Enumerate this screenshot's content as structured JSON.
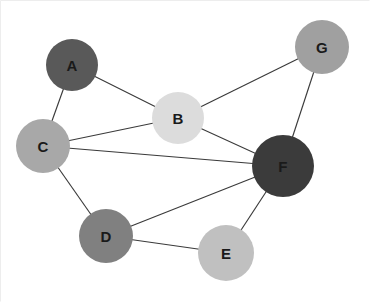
{
  "figure": {
    "background_color": "#ffffff",
    "width": 370,
    "height": 302,
    "frame_color": "#ededed"
  },
  "chart_data": {
    "type": "diagram",
    "subtype": "node-link-graph",
    "title": "",
    "directed": false,
    "edge_color": "#3a3a3a",
    "edge_width": 1.15,
    "node_count": 7,
    "edge_count": 11,
    "nodes": [
      {
        "id": "A",
        "label": "A",
        "x": 72,
        "y": 65,
        "r": 26,
        "color": "#595959",
        "label_color": "#141414"
      },
      {
        "id": "B",
        "label": "B",
        "x": 178,
        "y": 118,
        "r": 26,
        "color": "#dcdcdc",
        "label_color": "#141414"
      },
      {
        "id": "C",
        "label": "C",
        "x": 43,
        "y": 146,
        "r": 27,
        "color": "#a8a8a8",
        "label_color": "#141414"
      },
      {
        "id": "D",
        "label": "D",
        "x": 106,
        "y": 236,
        "r": 27,
        "color": "#808080",
        "label_color": "#141414"
      },
      {
        "id": "E",
        "label": "E",
        "x": 226,
        "y": 253,
        "r": 28,
        "color": "#c0c0c0",
        "label_color": "#141414"
      },
      {
        "id": "F",
        "label": "F",
        "x": 283,
        "y": 166,
        "r": 31,
        "color": "#3b3b3b",
        "label_color": "#111111"
      },
      {
        "id": "G",
        "label": "G",
        "x": 322,
        "y": 47,
        "r": 27,
        "color": "#a0a0a0",
        "label_color": "#141414"
      }
    ],
    "edges": [
      {
        "source": "A",
        "target": "B"
      },
      {
        "source": "A",
        "target": "C"
      },
      {
        "source": "B",
        "target": "C"
      },
      {
        "source": "B",
        "target": "G"
      },
      {
        "source": "B",
        "target": "F"
      },
      {
        "source": "C",
        "target": "F"
      },
      {
        "source": "C",
        "target": "D"
      },
      {
        "source": "D",
        "target": "F"
      },
      {
        "source": "D",
        "target": "E"
      },
      {
        "source": "E",
        "target": "F"
      },
      {
        "source": "G",
        "target": "F"
      }
    ],
    "legend": null,
    "axes": null,
    "grid": false
  }
}
